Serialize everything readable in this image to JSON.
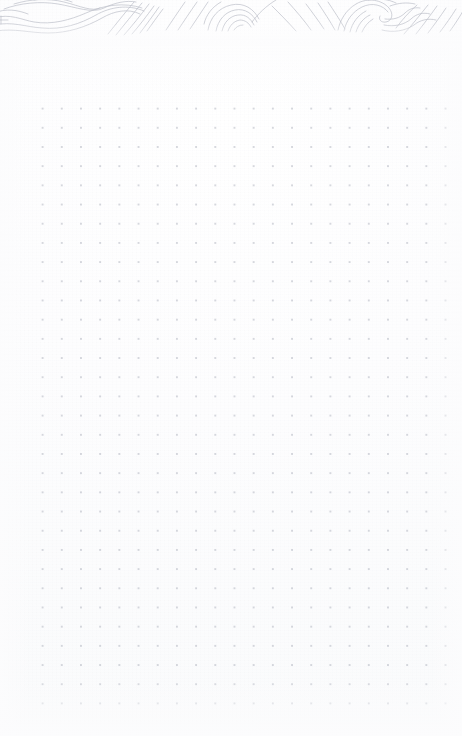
{
  "page": {
    "kind": "dot-grid-notebook-page",
    "title": "Blank dot grid notebook page",
    "width_px": 462,
    "height_px": 736,
    "background_color": "#fcfcfd",
    "visible_text": ""
  },
  "header_band": {
    "name": "topographic-line-band",
    "description": "Faint grey contour / fingerprint-like line artwork across the very top edge",
    "stroke_color": "#b9bcc6",
    "band_height_px": 46,
    "interactable": false
  },
  "dot_grid": {
    "name": "dot-grid",
    "dot_color": "#7a8092",
    "dot_opacity": 0.3,
    "dot_radius_px": 0.75,
    "spacing_px": 19.2,
    "origin_x_px": 33,
    "origin_y_px": 99,
    "columns": 22,
    "rows": 32,
    "right_edge_px": 433,
    "bottom_edge_px": 699
  },
  "margins": {
    "left_px": 33,
    "right_px": 29,
    "top_px": 99,
    "bottom_px": 37
  },
  "chart_data": {
    "type": "scatter",
    "title": "",
    "xlabel": "",
    "ylabel": "",
    "grid": true,
    "legend": "none",
    "note": "Regular dot lattice used as writing guide; no plotted data values."
  }
}
